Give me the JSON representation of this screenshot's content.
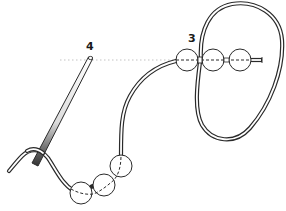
{
  "diagram": {
    "type": "beading-instruction-illustration",
    "labels": {
      "step_4": "4",
      "step_3": "3"
    },
    "colors": {
      "outline": "#2a2a2a",
      "thread_fill": "#ffffff",
      "needle_dark": "#333333",
      "guide_dots": "#bdbdbd"
    },
    "elements": {
      "needle": "needle",
      "thread": "thread",
      "top_beads": 3,
      "bottom_beads": 3,
      "guide_line": "dotted-guide-line"
    }
  }
}
